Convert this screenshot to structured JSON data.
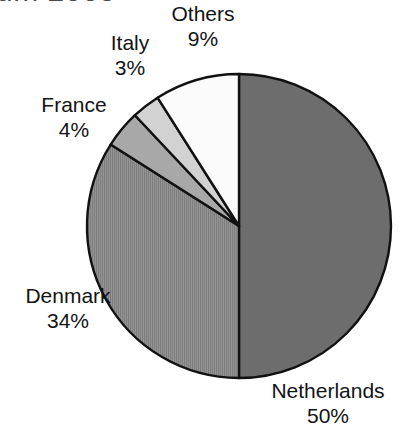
{
  "title": {
    "text": "um 2005",
    "note_clipped": true
  },
  "chart_data": {
    "type": "pie",
    "title": "um 2005",
    "categories": [
      "Netherlands",
      "Denmark",
      "Others",
      "France",
      "Italy"
    ],
    "values": [
      50,
      34,
      9,
      4,
      3
    ],
    "unit": "%",
    "start_angle_deg": 0,
    "direction": "clockwise",
    "legend": "none",
    "labels_position": "outside",
    "slices": [
      {
        "name": "Netherlands",
        "value": 50,
        "label": "Netherlands",
        "percent_label": "50%",
        "fill": "#6d6d6d",
        "pattern": "solid",
        "start_deg": 0,
        "end_deg": 180
      },
      {
        "name": "Denmark",
        "value": 34,
        "label": "Denmark",
        "percent_label": "34%",
        "fill": "#8c8c8c",
        "pattern": "vertical-hatch",
        "start_deg": 180,
        "end_deg": 302.4
      },
      {
        "name": "France",
        "value": 4,
        "label": "France",
        "percent_label": "4%",
        "fill": "#a8a8a8",
        "pattern": "solid",
        "start_deg": 302.4,
        "end_deg": 316.8
      },
      {
        "name": "Italy",
        "value": 3,
        "label": "Italy",
        "percent_label": "3%",
        "fill": "#d2d2d2",
        "pattern": "solid",
        "start_deg": 316.8,
        "end_deg": 327.6
      },
      {
        "name": "Others",
        "value": 9,
        "label": "Others",
        "percent_label": "9%",
        "fill": "#fbfbfb",
        "pattern": "solid",
        "start_deg": 327.6,
        "end_deg": 360
      }
    ],
    "geometry": {
      "center_x": 239,
      "center_y": 226,
      "radius": 152
    },
    "stroke_color": "#111111",
    "background": "#ffffff"
  },
  "labels": {
    "others": {
      "name": "Others",
      "pct": "9%"
    },
    "italy": {
      "name": "Italy",
      "pct": "3%"
    },
    "france": {
      "name": "France",
      "pct": "4%"
    },
    "denmark": {
      "name": "Denmark",
      "pct": "34%"
    },
    "netherlands": {
      "name": "Netherlands",
      "pct": "50%"
    }
  }
}
